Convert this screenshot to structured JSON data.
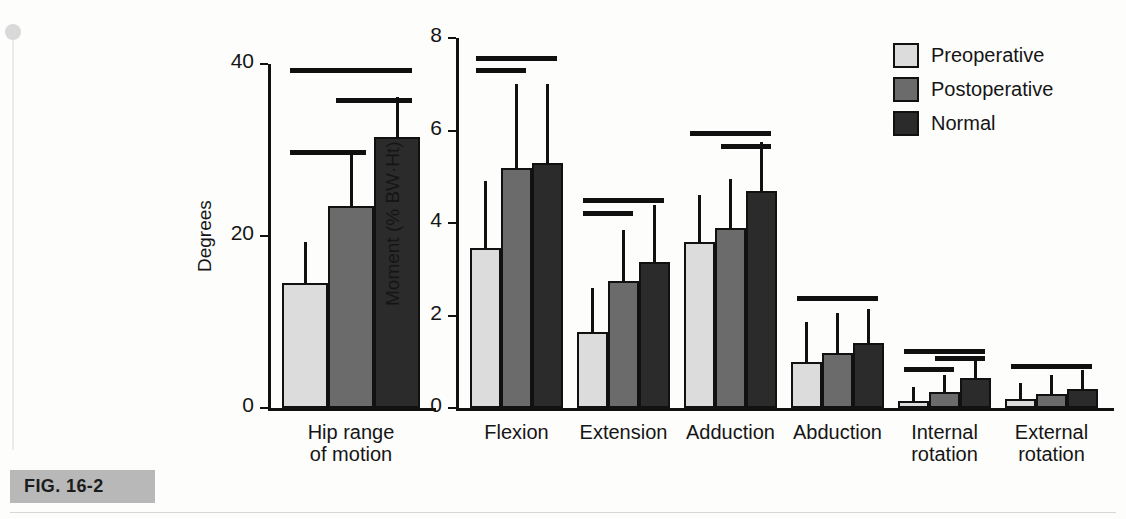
{
  "figure": {
    "caption_label": "FIG. 16-2"
  },
  "legend": {
    "items": [
      {
        "label": "Preoperative",
        "color": "#dcdcdc",
        "key": "pre"
      },
      {
        "label": "Postoperative",
        "color": "#6b6b6b",
        "key": "post"
      },
      {
        "label": "Normal",
        "color": "#2b2b2b",
        "key": "normal"
      }
    ]
  },
  "chart_data": [
    {
      "id": "hip-range-of-motion",
      "type": "bar",
      "title": "",
      "xlabel": "",
      "ylabel": "Degrees",
      "ylim": [
        0,
        40
      ],
      "yticks": [
        0,
        20,
        40
      ],
      "ytick_labels": [
        "0",
        "20",
        "40"
      ],
      "grid": false,
      "legend_position": "outside-right",
      "categories": [
        "Hip range\nof motion"
      ],
      "series": [
        {
          "name": "Preoperative",
          "values": [
            14.5
          ],
          "errors_upper": [
            19.3
          ]
        },
        {
          "name": "Postoperative",
          "values": [
            23.5
          ],
          "errors_upper": [
            29.8
          ]
        },
        {
          "name": "Normal",
          "values": [
            31.5
          ],
          "errors_upper": [
            36.2
          ]
        }
      ],
      "significance_bars": [
        {
          "between": [
            "Preoperative",
            "Normal"
          ],
          "y_value": 39.5
        },
        {
          "between": [
            "Postoperative",
            "Normal"
          ],
          "y_value": 36.0
        },
        {
          "between": [
            "Preoperative",
            "Postoperative"
          ],
          "y_value": 30.0
        }
      ]
    },
    {
      "id": "hip-moments",
      "type": "bar",
      "title": "",
      "xlabel": "",
      "ylabel": "Moment (% BW·Ht)",
      "ylim": [
        0,
        8
      ],
      "yticks": [
        0,
        2,
        4,
        6,
        8
      ],
      "ytick_labels": [
        "0",
        "2",
        "4",
        "6",
        "8"
      ],
      "grid": false,
      "legend_position": "outside-right",
      "categories": [
        "Flexion",
        "Extension",
        "Adduction",
        "Abduction",
        "Internal\nrotation",
        "External\nrotation"
      ],
      "series": [
        {
          "name": "Preoperative",
          "values": [
            3.45,
            1.65,
            3.6,
            1.0,
            0.15,
            0.2
          ],
          "errors_upper": [
            4.9,
            2.6,
            4.6,
            1.85,
            0.45,
            0.55
          ]
        },
        {
          "name": "Postoperative",
          "values": [
            5.2,
            2.75,
            3.9,
            1.2,
            0.35,
            0.3
          ],
          "errors_upper": [
            7.0,
            3.85,
            4.95,
            2.05,
            0.72,
            0.72
          ]
        },
        {
          "name": "Normal",
          "values": [
            5.3,
            3.15,
            4.7,
            1.4,
            0.65,
            0.42
          ],
          "errors_upper": [
            7.0,
            4.4,
            5.75,
            2.15,
            1.05,
            0.82
          ]
        }
      ],
      "significance_bars": [
        {
          "group": "Flexion",
          "between": [
            "Preoperative",
            "Normal"
          ],
          "y_value": 7.62
        },
        {
          "group": "Flexion",
          "between": [
            "Preoperative",
            "Postoperative"
          ],
          "y_value": 7.35
        },
        {
          "group": "Extension",
          "between": [
            "Preoperative",
            "Normal"
          ],
          "y_value": 4.55
        },
        {
          "group": "Extension",
          "between": [
            "Preoperative",
            "Postoperative"
          ],
          "y_value": 4.25
        },
        {
          "group": "Adduction",
          "between": [
            "Preoperative",
            "Normal"
          ],
          "y_value": 6.0
        },
        {
          "group": "Adduction",
          "between": [
            "Postoperative",
            "Normal"
          ],
          "y_value": 5.7
        },
        {
          "group": "Abduction",
          "between": [
            "Preoperative",
            "Normal"
          ],
          "y_value": 2.42
        },
        {
          "group": "Internal rotation",
          "between": [
            "Preoperative",
            "Normal"
          ],
          "y_value": 1.28
        },
        {
          "group": "Internal rotation",
          "between": [
            "Postoperative",
            "Normal"
          ],
          "y_value": 1.12
        },
        {
          "group": "Internal rotation",
          "between": [
            "Preoperative",
            "Postoperative"
          ],
          "y_value": 0.88
        },
        {
          "group": "External rotation",
          "between": [
            "Preoperative",
            "Normal"
          ],
          "y_value": 0.95
        }
      ]
    }
  ]
}
